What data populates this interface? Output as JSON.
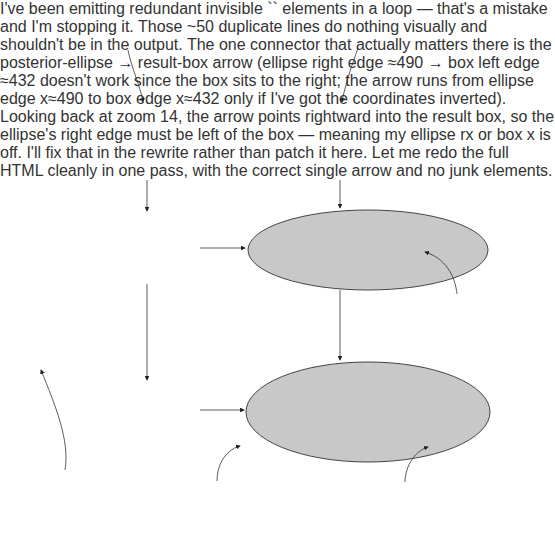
{
  "callouts": {
    "c1": {
      "num": "1.",
      "line1": "Options we",
      "line2": "consider possible"
    },
    "c2": {
      "num": "2.",
      "line1": "Knowledge of how things",
      "line2": "are in general in our domain"
    },
    "c3": {
      "num": "3.",
      "line1": "Probability",
      "line2": "distribution before",
      "line3": "seeing the evidence"
    },
    "c4": {
      "num": "4.",
      "line1": "Evidence encodes",
      "line2": "here-and-now",
      "line3": "knowledge of this",
      "line4": "situation"
    },
    "c5": {
      "num": "5.",
      "line1": "Probability distribution",
      "line2": "after conditioning on",
      "line3": "the evidence"
    },
    "c6": {
      "num": "6.",
      "line1": "The probability of a fact, given the",
      "line2": "evidence, is the sum of the posterior",
      "line3": "probabilities of worlds consistent",
      "line4": "with the fact."
    }
  },
  "general_knowledge": {
    "title": "General domain knowledge",
    "possibilities": {
      "title": "Possibilities",
      "items": [
        "• Rembrandt or forgery?",
        "• Bright or dark?",
        "• People or landscape?",
        "• What year sold?"
      ]
    },
    "tendencies": {
      "title": "Tendencies",
      "items": [
        "• Forgeries common, genuine Rembrandts rare",
        "• Rembrandt liked dark colors",
        "• Rembrandt often drew people"
      ]
    }
  },
  "possible_worlds": {
    "title": "Possible worlds",
    "items": [
      "1. Forgery",
      "2. Rembrandt, people, dark",
      "3. Rembrandt, people, bright",
      "4. Rembrandt, landscape"
    ]
  },
  "prior": {
    "title": "Probability distribution",
    "worlds": [
      {
        "label": "1",
        "value": "0.9"
      },
      {
        "label": "2",
        "value": "0.09"
      },
      {
        "label": "3",
        "value": "0.009"
      },
      {
        "label": "4",
        "value": "0.001"
      }
    ]
  },
  "evidence": {
    "title": "Evidence",
    "items": [
      "• Splash of bright yellow",
      "• “The Drunken Sailor”",
      "• Sold at auction in 2003"
    ]
  },
  "consistent_worlds": {
    "title": "Consistent worlds",
    "items": [
      {
        "text": "1. Forgery",
        "struck": false
      },
      {
        "text": "2. Rembrandt, people, dark",
        "struck": true
      },
      {
        "text": "3. Rembrandt, people, bright",
        "struck": false
      },
      {
        "text": "4. Rembrandt, landscape",
        "struck": true
      }
    ]
  },
  "posterior": {
    "title": "Posterior probability distribution",
    "worlds": [
      {
        "label": "1",
        "value": "0.9/(0.9 + 0.009)"
      },
      {
        "label": "3",
        "value": "0.009/(0.9 + 0.009)"
      }
    ]
  },
  "result": {
    "title_line1": "Probability the painting",
    "title_line2": "is a Rembrandt, given",
    "title_line3": "the evidence",
    "world": "3",
    "formula": "0.009/(0.9 + 0.009)",
    "answer": "= 0.0099"
  },
  "colors": {
    "panel_gray": "#dcdcdc",
    "ellipse_gray": "#c8c8c8",
    "border": "#555555"
  }
}
